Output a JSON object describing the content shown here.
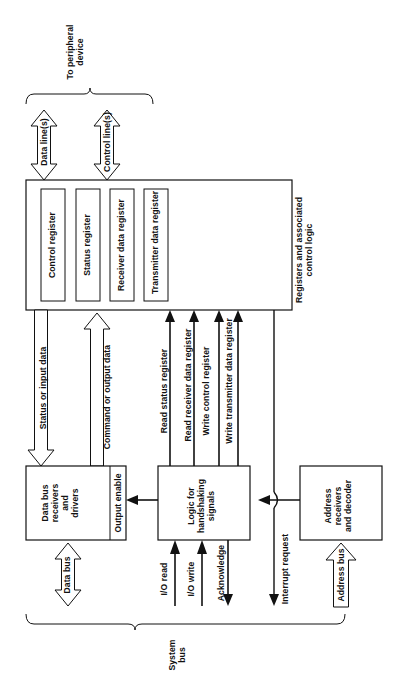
{
  "figure": {
    "type": "block-diagram",
    "orientation": "rotated-90-ccw"
  },
  "peripheral_side": {
    "brace_label": "To peripheral\ndevice",
    "lines": [
      {
        "name": "data-lines",
        "label": "Data line(s)",
        "arrow": "double"
      },
      {
        "name": "control-lines",
        "label": "Control line(s)",
        "arrow": "double"
      }
    ]
  },
  "register_block": {
    "outside_label": "Registers and associated\ncontrol logic",
    "registers": [
      {
        "label": "Control register"
      },
      {
        "label": "Status register"
      },
      {
        "label": "Receiver data register"
      },
      {
        "label": "Transmitter data register"
      }
    ]
  },
  "data_paths": [
    {
      "name": "status-or-input-data",
      "label": "Status or input data",
      "arrow": "single-down"
    },
    {
      "name": "command-or-output-data",
      "label": "Command or output data",
      "arrow": "single-up"
    }
  ],
  "control_signals": [
    {
      "label": "Read status register",
      "arrow": "up"
    },
    {
      "label": "Read receiver data register",
      "arrow": "up"
    },
    {
      "label": "Write control register",
      "arrow": "up"
    },
    {
      "label": "Write transmitter data register",
      "arrow": "up"
    }
  ],
  "blocks": [
    {
      "name": "data-bus-receivers-and-drivers",
      "label": "Data bus\nreceivers\nand\ndrivers",
      "pin_label": "Output enable"
    },
    {
      "name": "logic-for-handshaking-signals",
      "label": "Logic for\nhandshaking\nsignals"
    },
    {
      "name": "address-receivers-and-decoder",
      "label": "Address\nreceivers\nand decoder"
    }
  ],
  "bus_side": {
    "brace_label": "System\nbus",
    "signals": [
      {
        "name": "data-bus",
        "label": "Data bus",
        "arrow": "double"
      },
      {
        "name": "io-read",
        "label": "I/O read",
        "arrow": "in"
      },
      {
        "name": "io-write",
        "label": "I/O write",
        "arrow": "in"
      },
      {
        "name": "acknowledge",
        "label": "Acknowledge",
        "arrow": "out"
      },
      {
        "name": "interrupt-request",
        "label": "Interrupt request",
        "arrow": "out"
      },
      {
        "name": "address-bus",
        "label": "Address bus",
        "arrow": "in"
      }
    ]
  }
}
